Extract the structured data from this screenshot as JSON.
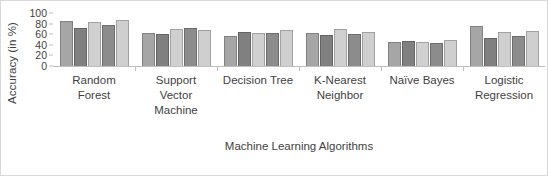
{
  "chart_data": {
    "type": "bar",
    "title": "",
    "xlabel": "Machine Learning Algorithms",
    "ylabel": "Accuracy  (in %)",
    "ylim": [
      0,
      100
    ],
    "yticks": [
      0,
      20,
      40,
      60,
      80,
      100
    ],
    "grid": false,
    "legend": "none",
    "categories": [
      "Random Forest",
      "Support Vector Machine",
      "Decision Tree",
      "K-Nearest Neighbor",
      "Naïve Bayes",
      "Logistic Regression"
    ],
    "category_lines": [
      [
        "Random",
        "Forest"
      ],
      [
        "Support",
        "Vector",
        "Machine"
      ],
      [
        "Decision Tree"
      ],
      [
        "K-Nearest",
        "Neighbor"
      ],
      [
        "Naïve Bayes"
      ],
      [
        "Logistic",
        "Regression"
      ]
    ],
    "series": [
      {
        "name": "Series 1",
        "color": "#a6a6a6",
        "values": [
          84,
          63,
          57,
          62,
          45,
          75
        ]
      },
      {
        "name": "Series 2",
        "color": "#808080",
        "values": [
          71,
          61,
          64,
          58,
          48,
          52
        ]
      },
      {
        "name": "Series 3",
        "color": "#d0d0d0",
        "values": [
          83,
          69,
          63,
          70,
          46,
          64
        ]
      },
      {
        "name": "Series 4",
        "color": "#8c8c8c",
        "values": [
          78,
          72,
          63,
          60,
          43,
          57
        ]
      },
      {
        "name": "Series 5",
        "color": "#cfcfcf",
        "values": [
          87,
          68,
          68,
          64,
          50,
          66
        ]
      }
    ]
  },
  "colors": {
    "axis": "#bfbfbf",
    "text": "#3f3f3f",
    "frame": "#d9d9d9",
    "background": "#ffffff"
  }
}
